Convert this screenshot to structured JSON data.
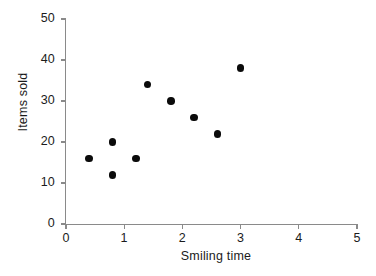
{
  "chart_data": {
    "type": "scatter",
    "title": "",
    "xlabel": "Smiling time",
    "ylabel": "Items sold",
    "xlim": [
      0,
      5
    ],
    "ylim": [
      0,
      50
    ],
    "xticks": [
      "0",
      "1",
      "2",
      "3",
      "4",
      "5"
    ],
    "yticks": [
      "0",
      "10",
      "20",
      "30",
      "40",
      "50"
    ],
    "grid": false,
    "legend": null,
    "marker": {
      "shape": "circle",
      "color": "#0b0b0b",
      "size": 7.6
    },
    "axis_color": "#8a8a8a",
    "text_color": "#1b1b1b",
    "background": "#ffffff",
    "points": [
      {
        "x": 0.4,
        "y": 16
      },
      {
        "x": 0.8,
        "y": 20
      },
      {
        "x": 0.8,
        "y": 12
      },
      {
        "x": 1.2,
        "y": 16
      },
      {
        "x": 1.4,
        "y": 34
      },
      {
        "x": 1.8,
        "y": 30
      },
      {
        "x": 2.2,
        "y": 26
      },
      {
        "x": 2.6,
        "y": 22
      },
      {
        "x": 3.0,
        "y": 38
      }
    ]
  }
}
